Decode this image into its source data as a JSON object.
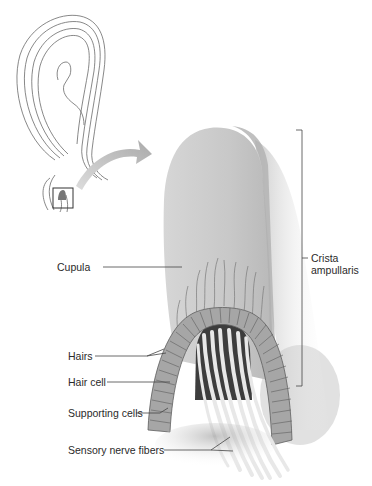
{
  "figure": {
    "inset": {
      "description": "semicircular canal with ampulla, boxed region enlarged",
      "arrow": "curved-arrow-to-enlargement"
    },
    "labels": {
      "cupula": "Cupula",
      "hairs": "Hairs",
      "hair_cell": "Hair cell",
      "supporting_cells": "Supporting cells",
      "sensory_nerve_fibers": "Sensory nerve fibers",
      "crista_line1": "Crista",
      "crista_line2": "ampullaris"
    },
    "colors": {
      "background": "#ffffff",
      "cupula": "#c9c9c9",
      "cupula_shadow": "#b3b3b3",
      "cells": "#9a9a9a",
      "cell_lines": "#5e5e5e",
      "nerve_dark": "#3a3a3a",
      "nerve_fiber": "#e6e6e6",
      "leader_line": "#444444",
      "arrow": "#b8b8b8",
      "inset_line": "#555555"
    }
  }
}
